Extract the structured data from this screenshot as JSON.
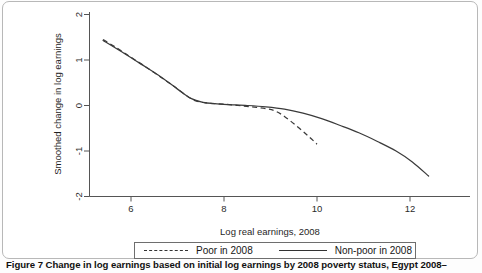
{
  "figure": {
    "caption": "Figure 7 Change in log earnings based on initial log earnings by 2008 poverty status, Egypt 2008–"
  },
  "legend": {
    "items": [
      {
        "label": "Poor in 2008",
        "style": "dashed"
      },
      {
        "label": "Non-poor in 2008",
        "style": "solid"
      }
    ]
  },
  "axes": {
    "x_title": "Log real earnings, 2008",
    "y_title": "Smoothed change in log earnings",
    "x_ticks": [
      "6",
      "8",
      "10",
      "12"
    ],
    "y_ticks": [
      "2",
      "1",
      "0",
      "-1",
      "-2"
    ]
  },
  "chart_data": {
    "type": "line",
    "title": "",
    "xlabel": "Log real earnings, 2008",
    "ylabel": "Smoothed change in log earnings",
    "xlim": [
      5.05,
      13.15
    ],
    "ylim": [
      -2.3,
      2.25
    ],
    "xticks": [
      6,
      8,
      10,
      12
    ],
    "yticks": [
      2,
      1,
      0,
      -1,
      -2
    ],
    "grid": false,
    "legend_position": "below-axes",
    "series": [
      {
        "name": "Poor in 2008",
        "style": "dashed",
        "color": "#3a3a3a",
        "x": [
          5.4,
          5.7,
          6.0,
          6.3,
          6.6,
          6.9,
          7.2,
          7.4,
          7.6,
          7.8,
          8.0,
          8.3,
          8.6,
          8.9,
          9.1,
          9.3,
          9.55,
          9.8,
          10.0
        ],
        "y": [
          1.45,
          1.26,
          1.06,
          0.86,
          0.65,
          0.44,
          0.21,
          0.1,
          0.06,
          0.04,
          0.03,
          0.0,
          -0.03,
          -0.07,
          -0.12,
          -0.24,
          -0.44,
          -0.66,
          -0.85
        ]
      },
      {
        "name": "Non-poor in 2008",
        "style": "solid",
        "color": "#3a3a3a",
        "x": [
          5.4,
          5.8,
          6.2,
          6.6,
          7.0,
          7.3,
          7.55,
          7.8,
          8.1,
          8.5,
          8.9,
          9.3,
          9.7,
          10.1,
          10.5,
          10.9,
          11.3,
          11.7,
          12.05,
          12.4
        ],
        "y": [
          1.43,
          1.18,
          0.92,
          0.66,
          0.36,
          0.15,
          0.07,
          0.04,
          0.02,
          0.0,
          -0.03,
          -0.08,
          -0.17,
          -0.29,
          -0.44,
          -0.6,
          -0.79,
          -1.0,
          -1.24,
          -1.55
        ]
      }
    ]
  }
}
